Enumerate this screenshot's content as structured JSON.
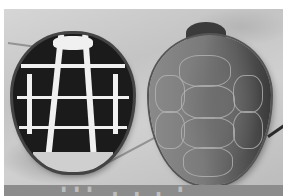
{
  "image": {
    "description": "Grayscale photograph of two turtle shells lying on sandy ground",
    "subjects": [
      {
        "name": "left turtle",
        "description": "domed shell with dark scutes separated by bright white/cream bands"
      },
      {
        "name": "right turtle",
        "description": "flattened oval shell, mid-gray with faint scute outlines and darker right edge"
      }
    ],
    "background": "light gray sand",
    "colors": {
      "margin": "#ffffff",
      "sand": "#cfcfcf",
      "left_shell_dark": "#1b1b1b",
      "left_shell_light": "#f0f0f0",
      "right_shell": "#7a7a7a",
      "caption_bar": "#8c8c8c"
    }
  },
  "caption": {
    "text": "▘▘▘  ▗    ▗  ▗   ▝"
  }
}
